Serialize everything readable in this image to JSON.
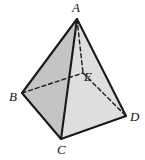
{
  "figure": {
    "kind": "solid-geometry-diagram",
    "list_marker": ")",
    "colors": {
      "face_left": "#c4c4c4",
      "face_right": "#dedede",
      "face_base_hidden": "#cfcfcf",
      "edge_solid": "#1a1a1a",
      "edge_dashed": "#1a1a1a",
      "background": "#ffffff",
      "label": "#111111"
    },
    "vertices": [
      {
        "id": "A",
        "label": "A",
        "x": 77,
        "y": 19,
        "role": "apex"
      },
      {
        "id": "B",
        "label": "B",
        "x": 22,
        "y": 93,
        "role": "base-left"
      },
      {
        "id": "C",
        "label": "C",
        "x": 61,
        "y": 139,
        "role": "base-front"
      },
      {
        "id": "D",
        "label": "D",
        "x": 126,
        "y": 116,
        "role": "base-right"
      },
      {
        "id": "E",
        "label": "E",
        "x": 83,
        "y": 73,
        "role": "base-back-hidden"
      }
    ],
    "faces": [
      {
        "id": "ABC",
        "points": "77,19 22,93 61,139",
        "style": "face_left"
      },
      {
        "id": "ACD",
        "points": "77,19 61,139 126,116",
        "style": "face_right"
      }
    ],
    "edges_solid": [
      {
        "id": "AB",
        "from": "A",
        "to": "B",
        "x1": 77,
        "y1": 19,
        "x2": 22,
        "y2": 93
      },
      {
        "id": "AC",
        "from": "A",
        "to": "C",
        "x1": 77,
        "y1": 19,
        "x2": 61,
        "y2": 139
      },
      {
        "id": "AD",
        "from": "A",
        "to": "D",
        "x1": 77,
        "y1": 19,
        "x2": 126,
        "y2": 116
      },
      {
        "id": "BC",
        "from": "B",
        "to": "C",
        "x1": 22,
        "y1": 93,
        "x2": 61,
        "y2": 139
      },
      {
        "id": "CD",
        "from": "C",
        "to": "D",
        "x1": 61,
        "y1": 139,
        "x2": 126,
        "y2": 116
      }
    ],
    "edges_dashed": [
      {
        "id": "AE",
        "from": "A",
        "to": "E",
        "x1": 77,
        "y1": 19,
        "x2": 83,
        "y2": 73
      },
      {
        "id": "BE",
        "from": "B",
        "to": "E",
        "x1": 22,
        "y1": 93,
        "x2": 83,
        "y2": 73
      },
      {
        "id": "ED",
        "from": "E",
        "to": "D",
        "x1": 83,
        "y1": 73,
        "x2": 126,
        "y2": 116
      }
    ]
  }
}
